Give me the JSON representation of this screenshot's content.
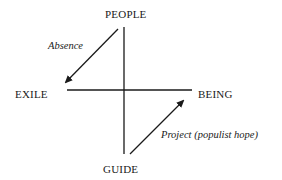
{
  "diagram": {
    "type": "semiotic-square",
    "nodes": {
      "top": "PEOPLE",
      "left": "EXILE",
      "right": "BEING",
      "bottom": "GUIDE"
    },
    "edges": [
      {
        "from": "PEOPLE",
        "to": "EXILE",
        "label": "Absence",
        "style": "arrow"
      },
      {
        "from": "GUIDE",
        "to": "BEING",
        "label": "Project (populist hope)",
        "style": "arrow"
      }
    ],
    "axes": {
      "vertical": "PEOPLE – GUIDE",
      "horizontal": "EXILE – BEING"
    },
    "colors": {
      "line": "#1a1a1a",
      "background": "#ffffff"
    }
  }
}
